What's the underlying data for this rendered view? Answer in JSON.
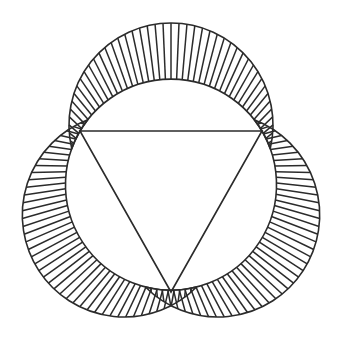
{
  "figure": {
    "background_color": "#ffffff",
    "stroke_color": "#2b2b2b",
    "hatch_color": "#2b2b2b",
    "canvas": {
      "width": 343,
      "height": 346
    },
    "stroke_width": 1.6,
    "hatch_stroke_width": 1.5,
    "hatch_count_per_lune": 46
  },
  "triangle": {
    "name": "equilateral-triangle",
    "vertices": [
      {
        "label": "A",
        "x": 80,
        "y": 131
      },
      {
        "label": "B",
        "x": 262,
        "y": 131
      },
      {
        "label": "C",
        "x": 171,
        "y": 292
      }
    ],
    "side_length": 182
  },
  "circumcircle": {
    "name": "circumcircle",
    "cx": 171,
    "cy": 184.6,
    "r": 105.5
  },
  "lunes": [
    {
      "name": "top-lune",
      "side": "AB",
      "outer_circle": {
        "cx": 171,
        "cy": 125.0,
        "r": 102.0
      },
      "chord_start": {
        "x": 80,
        "y": 131
      },
      "chord_end": {
        "x": 262,
        "y": 131
      },
      "outer_apex": {
        "x": 171,
        "y": 23
      },
      "inner_apex": {
        "x": 171,
        "y": 84
      }
    },
    {
      "name": "left-lune",
      "side": "AC",
      "outer_circle": {
        "cx": 124.3,
        "cy": 215.0,
        "r": 102.0
      },
      "chord_start": {
        "x": 80,
        "y": 131
      },
      "chord_end": {
        "x": 171,
        "y": 292
      },
      "outer_apex": {
        "x": 22,
        "y": 215
      },
      "inner_apex": {
        "x": 74,
        "y": 215
      }
    },
    {
      "name": "right-lune",
      "side": "BC",
      "outer_circle": {
        "cx": 217.7,
        "cy": 215.0,
        "r": 102.0
      },
      "chord_start": {
        "x": 262,
        "y": 131
      },
      "chord_end": {
        "x": 171,
        "y": 292
      },
      "outer_apex": {
        "x": 321,
        "y": 215
      },
      "inner_apex": {
        "x": 268,
        "y": 215
      }
    }
  ]
}
